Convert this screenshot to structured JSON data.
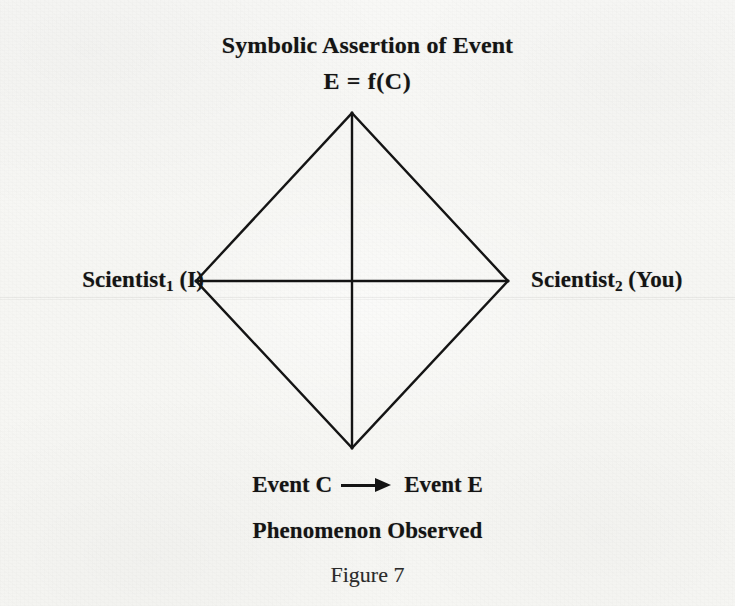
{
  "figure": {
    "title_line1": "Symbolic Assertion of Event",
    "title_line2": "E = f(C)",
    "left_label": {
      "name": "Scientist",
      "subscript": "1",
      "qualifier": "(I)"
    },
    "right_label": {
      "name": "Scientist",
      "subscript": "2",
      "qualifier": "(You)"
    },
    "bottom_row": {
      "left_term": "Event C",
      "arrow_icon": "right-arrow-icon",
      "right_term": "Event E"
    },
    "caption_phenomenon": "Phenomenon Observed",
    "caption_figure": "Figure 7"
  },
  "diagram_data": {
    "type": "diagram",
    "shape": "diamond-with-crossed-axes",
    "vertices": {
      "top": [
        352,
        113
      ],
      "right": [
        508,
        281
      ],
      "bottom": [
        352,
        448
      ],
      "left": [
        196,
        281
      ]
    },
    "center": [
      352,
      281
    ],
    "axes": [
      {
        "name": "vertical-axis",
        "from": [
          352,
          113
        ],
        "to": [
          352,
          448
        ]
      },
      {
        "name": "horizontal-axis",
        "from": [
          196,
          281
        ],
        "to": [
          508,
          281
        ]
      }
    ],
    "stroke_color": "#141414",
    "stroke_width": 2.4,
    "background_color": "#f7f7f5"
  }
}
